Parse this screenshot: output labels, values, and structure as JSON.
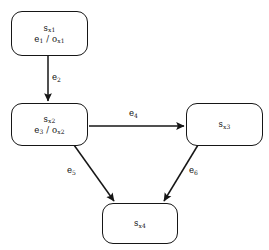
{
  "diagram": {
    "type": "state-transition-diagram",
    "background_color": "#ffffff",
    "stroke_color": "#161616",
    "text_color": "#111111",
    "width": 269,
    "height": 250,
    "nodes": [
      {
        "id": "sx1",
        "name": "state-node-sx1",
        "state_label": "s",
        "state_sub": "x1",
        "event_label": "e",
        "event_sub": "1",
        "separator": " / ",
        "output_label": "o",
        "output_sub": "x1",
        "x": 11,
        "y": 11,
        "width": 77,
        "height": 45
      },
      {
        "id": "sx2",
        "name": "state-node-sx2",
        "state_label": "s",
        "state_sub": "x2",
        "event_label": "e",
        "event_sub": "3",
        "separator": " / ",
        "output_label": "o",
        "output_sub": "x2",
        "x": 11,
        "y": 103,
        "width": 77,
        "height": 43
      },
      {
        "id": "sx3",
        "name": "state-node-sx3",
        "state_label": "s",
        "state_sub": "x3",
        "x": 186,
        "y": 103,
        "width": 77,
        "height": 43
      },
      {
        "id": "sx4",
        "name": "state-node-sx4",
        "state_label": "s",
        "state_sub": "x4",
        "x": 102,
        "y": 203,
        "width": 76,
        "height": 41
      }
    ],
    "edges": [
      {
        "id": "e2",
        "name": "edge-e2",
        "from": "sx1",
        "to": "sx2",
        "label": "e",
        "sub": "2",
        "label_x": 52,
        "label_y": 72,
        "x1": 48,
        "y1": 56,
        "x2": 48,
        "y2": 101
      },
      {
        "id": "e4",
        "name": "edge-e4",
        "from": "sx2",
        "to": "sx3",
        "label": "e",
        "sub": "4",
        "label_x": 129,
        "label_y": 108,
        "x1": 89,
        "y1": 126,
        "x2": 184,
        "y2": 126
      },
      {
        "id": "e5",
        "name": "edge-e5",
        "from": "sx2",
        "to": "sx4",
        "label": "e",
        "sub": "5",
        "label_x": 67,
        "label_y": 165,
        "x1": 74,
        "y1": 145,
        "x2": 114,
        "y2": 201
      },
      {
        "id": "e6",
        "name": "edge-e6",
        "from": "sx3",
        "to": "sx4",
        "label": "e",
        "sub": "6",
        "label_x": 189,
        "label_y": 165,
        "x1": 198,
        "y1": 145,
        "x2": 164,
        "y2": 201
      }
    ]
  }
}
